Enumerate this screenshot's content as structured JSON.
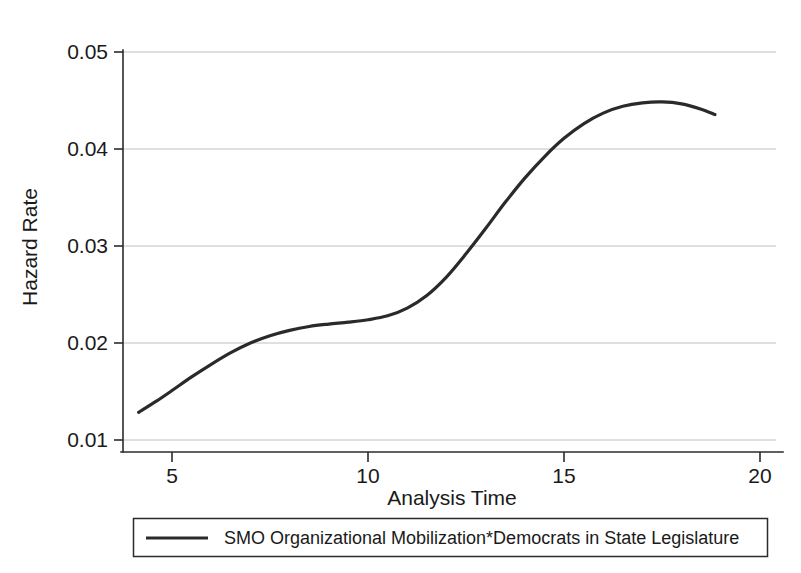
{
  "chart_data": {
    "type": "line",
    "title": "",
    "xlabel": "Analysis Time",
    "ylabel": "Hazard Rate",
    "xlim": [
      4.0,
      18.9
    ],
    "ylim": [
      0.01,
      0.05
    ],
    "xticks": [
      5,
      10,
      15,
      20
    ],
    "xtick_labels": [
      "5",
      "10",
      "15",
      "20"
    ],
    "yticks": [
      0.01,
      0.02,
      0.03,
      0.04,
      0.05
    ],
    "ytick_labels": [
      "0.01",
      "0.02",
      "0.03",
      "0.04",
      "0.05"
    ],
    "grid": "horizontal",
    "legend_position": "bottom-outside",
    "line_color": "#2a2a2a",
    "grid_color": "#b9b9b9",
    "axis_color": "#2b2b2b",
    "series": [
      {
        "name": "SMO Organizational Mobilization*Democrats in State Legislature",
        "x": [
          4.15,
          4.6,
          5.0,
          5.5,
          6.0,
          6.5,
          7.0,
          7.5,
          8.0,
          8.5,
          9.0,
          9.5,
          10.0,
          10.5,
          11.0,
          11.5,
          12.0,
          12.5,
          13.0,
          13.5,
          14.0,
          14.5,
          15.0,
          15.5,
          16.0,
          16.5,
          17.0,
          17.5,
          18.0,
          18.5,
          18.85
        ],
        "y": [
          0.01285,
          0.014,
          0.0151,
          0.0165,
          0.0178,
          0.019,
          0.02,
          0.02075,
          0.0213,
          0.0217,
          0.02195,
          0.02215,
          0.0224,
          0.0228,
          0.0236,
          0.0249,
          0.0268,
          0.0292,
          0.0318,
          0.0345,
          0.037,
          0.0392,
          0.0411,
          0.0426,
          0.0437,
          0.0444,
          0.04475,
          0.04485,
          0.04465,
          0.0441,
          0.04355
        ]
      }
    ]
  },
  "axes": {
    "y_axis_label": "Hazard Rate",
    "x_axis_label": "Analysis Time"
  },
  "legend": {
    "entries": [
      {
        "label": "SMO Organizational Mobilization*Democrats in State Legislature"
      }
    ]
  }
}
